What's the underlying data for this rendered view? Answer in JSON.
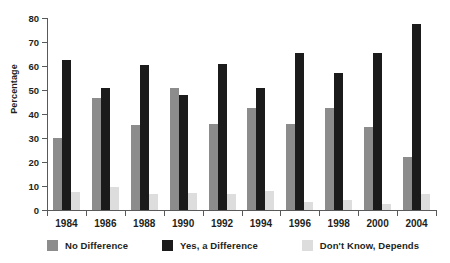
{
  "chart_data": {
    "type": "bar",
    "title": "",
    "xlabel": "",
    "ylabel": "Percentage",
    "ylim": [
      0,
      80
    ],
    "yticks": [
      0,
      10,
      20,
      30,
      40,
      50,
      60,
      70,
      80
    ],
    "grid": false,
    "legend_position": "bottom",
    "categories": [
      "1984",
      "1986",
      "1988",
      "1990",
      "1992",
      "1994",
      "1996",
      "1998",
      "2000",
      "2004"
    ],
    "series": [
      {
        "name": "No Difference",
        "color": "#8c8c8c",
        "values": [
          30,
          46.5,
          35.5,
          51,
          36,
          42.5,
          36,
          42.5,
          34.5,
          22
        ]
      },
      {
        "name": "Yes, a Difference",
        "color": "#1b1b1b",
        "values": [
          62.5,
          51,
          60.5,
          48,
          61,
          51,
          65.5,
          57,
          65.5,
          77.5
        ]
      },
      {
        "name": "Don't Know, Depends",
        "color": "#dddddd",
        "values": [
          7.5,
          9.5,
          6.5,
          7,
          6.5,
          8,
          3.5,
          4,
          2.5,
          6.5
        ]
      }
    ]
  },
  "axis": {
    "y_title": "Percentage"
  }
}
